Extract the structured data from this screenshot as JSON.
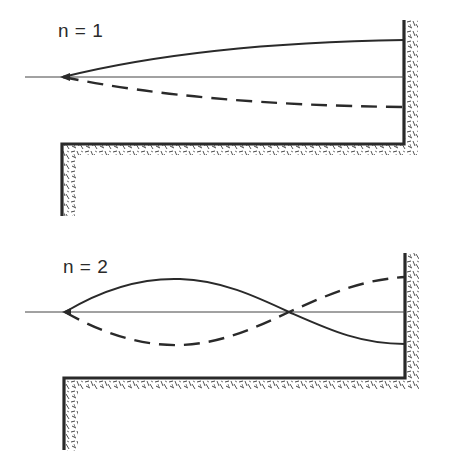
{
  "figures": [
    {
      "id": "mode-1",
      "label": "n = 1",
      "description": "First normal mode of a string fixed at the wall, free-sliding at the left apex",
      "curves": [
        {
          "style": "solid",
          "end_y_offset": -37
        },
        {
          "style": "dashed",
          "end_y_offset": 30
        }
      ]
    },
    {
      "id": "mode-2",
      "label": "n = 2",
      "description": "Second normal mode with one node crossing the axis",
      "curves": [
        {
          "style": "solid",
          "shape": "up-then-down"
        },
        {
          "style": "dashed",
          "shape": "down-then-up"
        }
      ]
    }
  ],
  "colors": {
    "line": "#2a2a2a",
    "hatch": "#3a3a3a",
    "background": "#ffffff"
  }
}
